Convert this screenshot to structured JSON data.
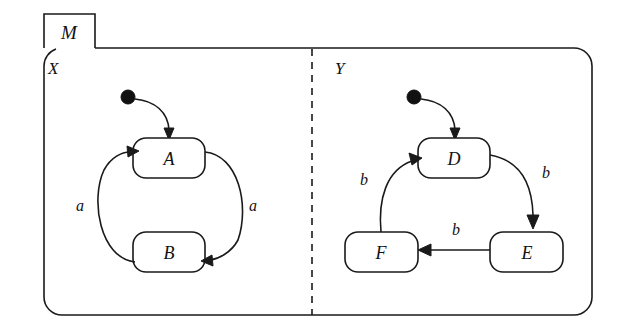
{
  "diagram": {
    "type": "uml-state-machine",
    "title": "M",
    "tab_label": "M",
    "regions": [
      {
        "id": "X",
        "label": "X",
        "states": [
          "A",
          "B"
        ],
        "initial_state": "A",
        "transitions": [
          {
            "from": "A",
            "to": "B",
            "label": "a"
          },
          {
            "from": "B",
            "to": "A",
            "label": "a"
          }
        ]
      },
      {
        "id": "Y",
        "label": "Y",
        "states": [
          "D",
          "E",
          "F"
        ],
        "initial_state": "D",
        "transitions": [
          {
            "from": "D",
            "to": "E",
            "label": "b"
          },
          {
            "from": "E",
            "to": "F",
            "label": "b"
          },
          {
            "from": "F",
            "to": "D",
            "label": "b"
          }
        ]
      }
    ],
    "states": {
      "A": "A",
      "B": "B",
      "D": "D",
      "E": "E",
      "F": "F"
    },
    "transition_labels": {
      "x_left": "a",
      "x_right": "a",
      "y_left": "b",
      "y_right": "b",
      "y_bottom": "b"
    },
    "colors": {
      "stroke": "#1a1a1a",
      "fill": "#ffffff",
      "initial_dot": "#111111"
    }
  }
}
